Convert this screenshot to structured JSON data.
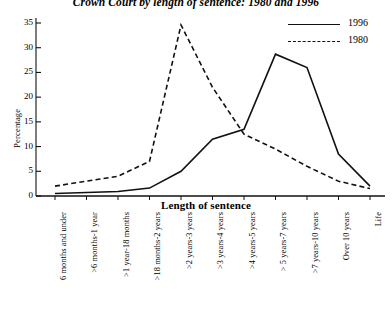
{
  "chart_data": {
    "type": "line",
    "title": "Crown Court by length of sentence: 1980 and 1996",
    "xlabel": "Length of sentence",
    "ylabel": "Percentage",
    "ylim": [
      0,
      35
    ],
    "yticks": [
      0,
      5,
      10,
      15,
      20,
      25,
      30,
      35
    ],
    "grid": false,
    "legend_position": "top-right",
    "categories": [
      "6 months and under",
      ">6 months-1 year",
      ">1 year-18 months",
      ">18 months-2 years",
      ">2 years-3 years",
      ">3 years-4 years",
      ">4 years-5 years",
      "> 5 years-7 years",
      ">7 years-10 years",
      "Over 10 years",
      "Life"
    ],
    "series": [
      {
        "name": "1996",
        "style": "solid",
        "color": "#111111",
        "values": [
          0.5,
          0.7,
          0.9,
          1.6,
          5.0,
          11.5,
          13.5,
          28.7,
          26.0,
          8.5,
          2.0
        ]
      },
      {
        "name": "1980",
        "style": "dashed",
        "color": "#111111",
        "values": [
          2.0,
          3.0,
          4.0,
          7.0,
          34.6,
          22.0,
          12.5,
          9.5,
          6.0,
          3.0,
          1.5
        ]
      }
    ]
  },
  "legend": {
    "items": [
      {
        "label": "1996",
        "style": "solid"
      },
      {
        "label": "1980",
        "style": "dashed"
      }
    ]
  }
}
